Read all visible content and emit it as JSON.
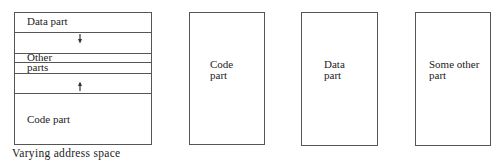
{
  "diagram": {
    "varying_space": {
      "segments": [
        {
          "label": "Data part"
        },
        {
          "label": ""
        },
        {
          "label": "Other"
        },
        {
          "label": "parts"
        },
        {
          "label": ""
        },
        {
          "label": "Code part"
        }
      ],
      "arrows": [
        {
          "direction": "down",
          "icon": "arrow-down-icon"
        },
        {
          "direction": "up",
          "icon": "arrow-up-icon"
        }
      ],
      "caption": "Varying address space"
    },
    "separate_spaces": [
      {
        "line1": "Code",
        "line2": "part"
      },
      {
        "line1": "Data",
        "line2": "part"
      },
      {
        "line1": "Some other",
        "line2": "part"
      }
    ],
    "colors": {
      "line": "#555555",
      "text": "#222222",
      "background": "#ffffff"
    }
  }
}
